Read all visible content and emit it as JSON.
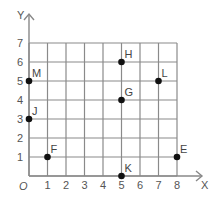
{
  "chart_data": {
    "type": "scatter",
    "title": "",
    "xlabel": "X",
    "ylabel": "Y",
    "origin_label": "O",
    "xlim": [
      0,
      8
    ],
    "ylim": [
      0,
      7
    ],
    "grid": true,
    "x_ticks": [
      "1",
      "2",
      "3",
      "4",
      "5",
      "6",
      "7",
      "8"
    ],
    "y_ticks": [
      "1",
      "2",
      "3",
      "4",
      "5",
      "6",
      "7"
    ],
    "points": [
      {
        "label": "H",
        "x": 5,
        "y": 6
      },
      {
        "label": "M",
        "x": 0,
        "y": 5
      },
      {
        "label": "L",
        "x": 7,
        "y": 5
      },
      {
        "label": "G",
        "x": 5,
        "y": 4
      },
      {
        "label": "J",
        "x": 0,
        "y": 3
      },
      {
        "label": "F",
        "x": 1,
        "y": 1
      },
      {
        "label": "E",
        "x": 8,
        "y": 1
      },
      {
        "label": "K",
        "x": 5,
        "y": 0
      }
    ]
  },
  "colors": {
    "grid": "#8a8a8a",
    "axis": "#888888",
    "point": "#111111",
    "text": "#555555"
  }
}
